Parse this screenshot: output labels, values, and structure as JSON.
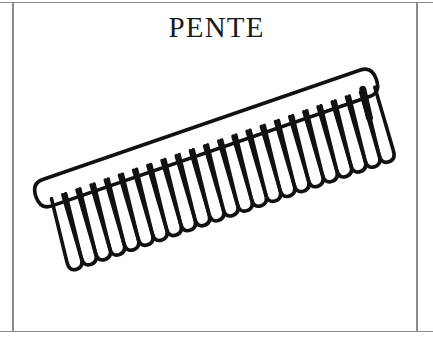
{
  "page": {
    "width": 433,
    "height": 340,
    "background_color": "#ffffff",
    "border_color": "#8a8a8f"
  },
  "title": {
    "text": "PENTE",
    "color": "#1a1a1a"
  },
  "illustration": {
    "subject": "comb",
    "style": "black line drawing / outline clip-art",
    "stroke_color": "#111111",
    "fill_color": "#ffffff",
    "rotation_degrees": -19,
    "tooth_count": 23,
    "description": "A hair comb drawn in outline, tilted with the right end raised. The spine is a long rounded bar and the teeth are drawn as a continuous zigzag of narrow elongated loops below it. The far-right tooth is drawn thicker / partly filled."
  }
}
